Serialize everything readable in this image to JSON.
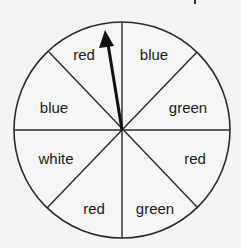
{
  "spinner": {
    "center": [
      122,
      130
    ],
    "radius": 108,
    "sections": [
      {
        "label": "blue",
        "x": 154,
        "y": 60
      },
      {
        "label": "green",
        "x": 188,
        "y": 113
      },
      {
        "label": "red",
        "x": 195,
        "y": 164
      },
      {
        "label": "green",
        "x": 155,
        "y": 214
      },
      {
        "label": "red",
        "x": 94,
        "y": 214
      },
      {
        "label": "white",
        "x": 56,
        "y": 164
      },
      {
        "label": "blue",
        "x": 54,
        "y": 113
      },
      {
        "label": "red",
        "x": 84,
        "y": 60
      }
    ],
    "arrow": {
      "points_to": "red"
    }
  }
}
